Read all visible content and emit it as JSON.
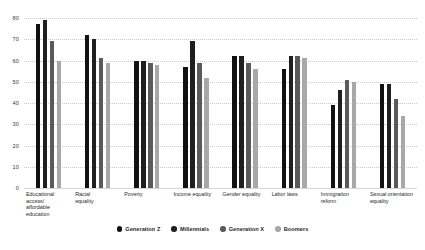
{
  "chart_data": {
    "type": "bar",
    "title": "",
    "subtitle": "",
    "xlabel": "",
    "ylabel": "",
    "ylim": [
      0,
      80
    ],
    "yticks": [
      80,
      70,
      60,
      50,
      40,
      30,
      20,
      10,
      0
    ],
    "grid": true,
    "legend_position": "bottom",
    "categories": [
      "Educational access/\naffordable education",
      "Racial\nequality",
      "Poverty",
      "Income equality",
      "Gender equality",
      "Labor laws",
      "Immigration\nreform",
      "Sexual orientation\nequality"
    ],
    "series": [
      {
        "name": "Generation Z",
        "color": "#111111",
        "values": [
          77,
          72,
          60,
          57,
          62,
          56,
          39,
          49
        ]
      },
      {
        "name": "Millennials",
        "color": "#1f1f1f",
        "values": [
          79,
          70,
          60,
          69,
          62,
          62,
          46,
          49
        ]
      },
      {
        "name": "Generation X",
        "color": "#5a5a5a",
        "values": [
          69,
          61,
          59,
          59,
          59,
          62,
          51,
          42
        ]
      },
      {
        "name": "Boomers",
        "color": "#a8a8a8",
        "values": [
          60,
          59,
          58,
          52,
          56,
          61,
          50,
          34
        ]
      }
    ]
  }
}
